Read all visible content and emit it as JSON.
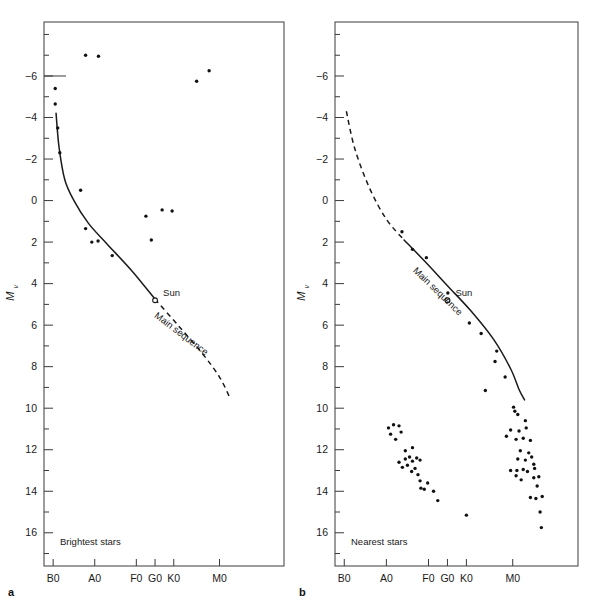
{
  "figure": {
    "panel_a_letter": "a",
    "panel_b_letter": "b"
  },
  "panels": {
    "a": {
      "caption": "Brightest stars",
      "sun_label": "Sun",
      "ms_label": "Main sequence",
      "ylabel_main": "M",
      "ylabel_sub": "v"
    },
    "b": {
      "caption": "Nearest stars",
      "sun_label": "Sun",
      "ms_label": "Main sequence",
      "ylabel_main": "M",
      "ylabel_sub": "v"
    }
  },
  "axes": {
    "y_tick_labels": [
      "-6",
      "-4",
      "-2",
      "0",
      "2",
      "4",
      "6",
      "8",
      "10",
      "12",
      "14",
      "16"
    ],
    "y_tick_values": [
      -6,
      -4,
      -2,
      0,
      2,
      4,
      6,
      8,
      10,
      12,
      14,
      16
    ],
    "y_minor_values": [
      -8,
      -7,
      -5,
      -3,
      -1,
      1,
      3,
      5,
      7,
      9,
      11,
      13,
      15,
      17
    ],
    "y_range": [
      -8.6,
      17.6
    ],
    "x_tick_labels": [
      "B0",
      "A0",
      "F0",
      "G0",
      "K0",
      "M0"
    ],
    "x_tick_values": [
      0,
      1,
      2,
      2.45,
      2.9,
      4.0
    ],
    "x_range": [
      -0.22,
      5.55
    ]
  },
  "chart_data": {
    "type": "scatter",
    "xlabel": "Spectral type",
    "ylabel": "M_v (absolute visual magnitude)",
    "xlim": [
      -0.22,
      5.55
    ],
    "ylim": [
      17.6,
      -8.6
    ],
    "grid": false,
    "legend": "none",
    "note": "x given in spectral-class units where B0=0, A0=1, F0=2, G0=2.45, K0=2.9, M0=4.0; y is absolute visual magnitude M_v (inverted axis).",
    "series": [
      {
        "name": "Brightest stars",
        "panel": "a",
        "marker": "filled-circle",
        "points": [
          [
            0.78,
            -7.0
          ],
          [
            1.09,
            -6.95
          ],
          [
            3.75,
            -6.25
          ],
          [
            3.45,
            -5.75
          ],
          [
            0.05,
            -5.4
          ],
          [
            0.05,
            -4.65
          ],
          [
            0.11,
            -3.5
          ],
          [
            0.16,
            -2.3
          ],
          [
            0.66,
            -0.5
          ],
          [
            0.78,
            1.35
          ],
          [
            0.93,
            2.0
          ],
          [
            1.08,
            1.95
          ],
          [
            1.42,
            2.65
          ],
          [
            2.23,
            0.75
          ],
          [
            2.62,
            0.45
          ],
          [
            2.86,
            0.5
          ],
          [
            2.36,
            1.9
          ]
        ]
      },
      {
        "name": "Nearest stars",
        "panel": "b",
        "marker": "filled-circle",
        "points": [
          [
            1.37,
            1.5
          ],
          [
            1.62,
            2.35
          ],
          [
            1.95,
            2.75
          ],
          [
            2.46,
            4.45
          ],
          [
            2.97,
            5.9
          ],
          [
            3.25,
            6.4
          ],
          [
            3.62,
            7.25
          ],
          [
            3.58,
            7.75
          ],
          [
            3.82,
            8.5
          ],
          [
            3.35,
            9.15
          ],
          [
            1.05,
            10.95
          ],
          [
            1.17,
            10.8
          ],
          [
            1.3,
            10.85
          ],
          [
            1.1,
            11.25
          ],
          [
            1.35,
            11.15
          ],
          [
            1.22,
            11.5
          ],
          [
            1.45,
            12.05
          ],
          [
            1.62,
            11.9
          ],
          [
            1.3,
            12.6
          ],
          [
            1.45,
            12.45
          ],
          [
            1.55,
            12.35
          ],
          [
            1.62,
            12.55
          ],
          [
            1.72,
            12.4
          ],
          [
            1.8,
            12.5
          ],
          [
            1.38,
            12.85
          ],
          [
            1.5,
            12.75
          ],
          [
            1.68,
            12.9
          ],
          [
            1.75,
            13.2
          ],
          [
            1.8,
            13.5
          ],
          [
            1.82,
            13.85
          ],
          [
            1.9,
            13.9
          ],
          [
            1.98,
            13.6
          ],
          [
            2.12,
            14.0
          ],
          [
            2.22,
            14.45
          ],
          [
            1.6,
            13.05
          ],
          [
            2.9,
            15.15
          ],
          [
            4.02,
            9.95
          ],
          [
            4.05,
            10.15
          ],
          [
            4.12,
            10.3
          ],
          [
            4.3,
            10.6
          ],
          [
            3.95,
            11.05
          ],
          [
            4.15,
            11.1
          ],
          [
            4.32,
            10.95
          ],
          [
            3.85,
            11.35
          ],
          [
            4.08,
            11.5
          ],
          [
            4.25,
            11.45
          ],
          [
            4.42,
            11.55
          ],
          [
            4.18,
            12.05
          ],
          [
            4.38,
            12.15
          ],
          [
            4.12,
            12.45
          ],
          [
            4.3,
            12.5
          ],
          [
            4.45,
            12.35
          ],
          [
            4.5,
            12.7
          ],
          [
            3.95,
            13.0
          ],
          [
            4.1,
            13.0
          ],
          [
            4.25,
            12.95
          ],
          [
            4.35,
            13.05
          ],
          [
            4.52,
            12.9
          ],
          [
            4.08,
            13.25
          ],
          [
            4.2,
            13.45
          ],
          [
            4.5,
            13.35
          ],
          [
            4.62,
            13.3
          ],
          [
            4.58,
            13.75
          ],
          [
            4.42,
            14.3
          ],
          [
            4.55,
            14.35
          ],
          [
            4.7,
            14.25
          ],
          [
            4.65,
            15.0
          ],
          [
            4.68,
            15.75
          ]
        ]
      }
    ],
    "curves": [
      {
        "name": "main-sequence-solid-a",
        "panel": "a",
        "style": "solid",
        "points": [
          [
            0.07,
            -4.2
          ],
          [
            0.14,
            -2.6
          ],
          [
            0.28,
            -1.0
          ],
          [
            0.5,
            0.0
          ],
          [
            0.85,
            1.1
          ],
          [
            1.3,
            2.1
          ],
          [
            1.9,
            3.4
          ],
          [
            2.45,
            4.75
          ]
        ]
      },
      {
        "name": "main-sequence-dashed-a",
        "panel": "a",
        "style": "dashed",
        "points": [
          [
            2.45,
            4.75
          ],
          [
            3.0,
            6.0
          ],
          [
            3.6,
            7.4
          ],
          [
            4.0,
            8.5
          ],
          [
            4.25,
            9.5
          ]
        ]
      },
      {
        "name": "main-sequence-dashed-b",
        "panel": "b",
        "style": "dashed",
        "points": [
          [
            0.05,
            -4.3
          ],
          [
            0.25,
            -2.5
          ],
          [
            0.6,
            -0.6
          ],
          [
            1.0,
            0.9
          ],
          [
            1.42,
            1.9
          ]
        ]
      },
      {
        "name": "main-sequence-solid-b",
        "panel": "b",
        "style": "solid",
        "points": [
          [
            1.42,
            1.9
          ],
          [
            1.9,
            2.9
          ],
          [
            2.45,
            4.1
          ],
          [
            3.0,
            5.3
          ],
          [
            3.55,
            6.7
          ],
          [
            3.95,
            8.1
          ],
          [
            4.15,
            9.1
          ],
          [
            4.28,
            9.6
          ]
        ]
      }
    ],
    "sun": {
      "x": 2.45,
      "y": 4.8,
      "label": "Sun"
    }
  }
}
